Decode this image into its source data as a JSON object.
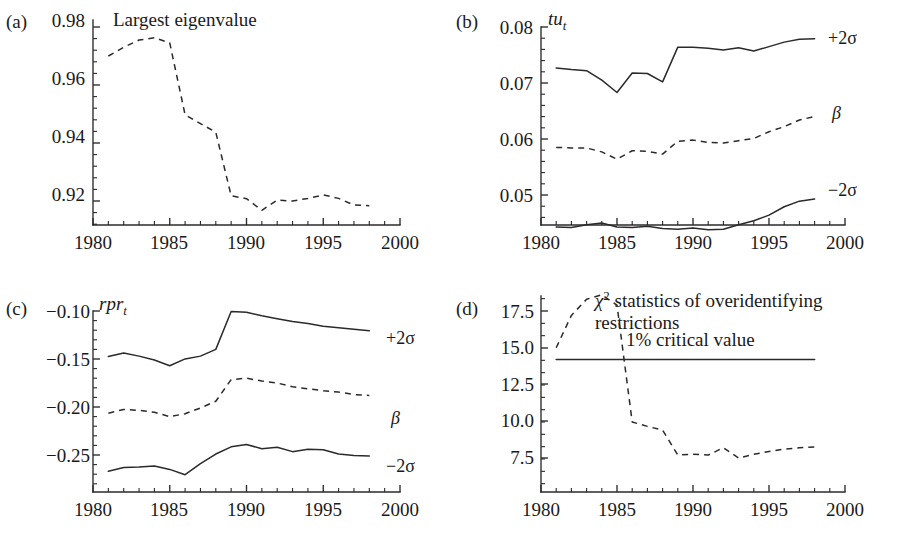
{
  "figure": {
    "background": "#ffffff",
    "ink": "#2a2a2a"
  },
  "panels": {
    "a": {
      "letter": "(a)",
      "title": "Largest eigenvalue",
      "x_ticks": [
        "1980",
        "1985",
        "1990",
        "1995",
        "2000"
      ],
      "y_ticks": [
        "0.98",
        "0.96",
        "0.94",
        "0.92"
      ]
    },
    "b": {
      "letter": "(b)",
      "title_main": "tu",
      "title_sub": "t",
      "x_ticks": [
        "1980",
        "1985",
        "1990",
        "1995",
        "2000"
      ],
      "y_ticks": [
        "0.08",
        "0.07",
        "0.06",
        "0.05"
      ],
      "label_upper": "+2σ",
      "label_mid": "β",
      "label_lower": "−2σ"
    },
    "c": {
      "letter": "(c)",
      "title_main": "rpr",
      "title_sub": "t",
      "x_ticks": [
        "1980",
        "1985",
        "1990",
        "1995",
        "2000"
      ],
      "y_ticks": [
        "−0.10",
        "−0.15",
        "−0.20",
        "−0.25"
      ],
      "label_upper": "+2σ",
      "label_mid": "β",
      "label_lower": "−2σ"
    },
    "d": {
      "letter": "(d)",
      "title_sym": "χ",
      "title_sup": "2",
      "title_line1": " statistics of overidentifying",
      "title_line2": "restrictions",
      "critical_label": "1% critical value",
      "x_ticks": [
        "1980",
        "1985",
        "1990",
        "1995",
        "2000"
      ],
      "y_ticks": [
        "17.5",
        "15.0",
        "12.5",
        "10.0",
        "7.5"
      ]
    }
  },
  "chart_data": [
    {
      "type": "line",
      "panel": "a",
      "title": "Largest eigenvalue",
      "xlabel": "",
      "ylabel": "",
      "xlim": [
        1980,
        2000
      ],
      "ylim": [
        0.9125,
        0.98
      ],
      "grid": false,
      "legend": "none",
      "x": [
        1981,
        1982,
        1983,
        1984,
        1985,
        1986,
        1987,
        1988,
        1989,
        1990,
        1991,
        1992,
        1993,
        1994,
        1995,
        1996,
        1997,
        1998
      ],
      "series": [
        {
          "name": "Largest eigenvalue",
          "style": "dashed",
          "values": [
            0.97,
            0.973,
            0.9755,
            0.9763,
            0.9745,
            0.9497,
            0.9467,
            0.9437,
            0.9218,
            0.9208,
            0.9168,
            0.9203,
            0.92,
            0.9209,
            0.9221,
            0.9209,
            0.9186,
            0.9184
          ]
        }
      ]
    },
    {
      "type": "line",
      "panel": "b",
      "title": "tu_t",
      "xlabel": "",
      "ylabel": "",
      "xlim": [
        1980,
        2000
      ],
      "ylim": [
        0.0425,
        0.08
      ],
      "grid": false,
      "legend": "right-inline",
      "x": [
        1981,
        1982,
        1983,
        1984,
        1985,
        1986,
        1987,
        1988,
        1989,
        1990,
        1991,
        1992,
        1993,
        1994,
        1995,
        1996,
        1997,
        1998
      ],
      "series": [
        {
          "name": "+2σ",
          "style": "solid",
          "values": [
            0.0727,
            0.0724,
            0.0722,
            0.0705,
            0.0683,
            0.0718,
            0.0717,
            0.0702,
            0.0764,
            0.0764,
            0.0762,
            0.0759,
            0.0763,
            0.0757,
            0.0765,
            0.0773,
            0.0778,
            0.0779
          ]
        },
        {
          "name": "β",
          "style": "dashed",
          "values": [
            0.0585,
            0.0584,
            0.0584,
            0.0577,
            0.0564,
            0.0579,
            0.0578,
            0.0573,
            0.0596,
            0.0598,
            0.0594,
            0.0593,
            0.0597,
            0.0601,
            0.0613,
            0.0622,
            0.0634,
            0.064
          ]
        },
        {
          "name": "−2σ",
          "style": "solid",
          "values": [
            0.0443,
            0.0442,
            0.0447,
            0.045,
            0.0443,
            0.0442,
            0.0444,
            0.044,
            0.0439,
            0.0441,
            0.0438,
            0.0439,
            0.0447,
            0.0454,
            0.0464,
            0.0479,
            0.0489,
            0.0493
          ]
        }
      ]
    },
    {
      "type": "line",
      "panel": "c",
      "title": "rpr_t",
      "xlabel": "",
      "ylabel": "",
      "xlim": [
        1980,
        2000
      ],
      "ylim": [
        -0.2745,
        -0.0955
      ],
      "grid": false,
      "legend": "right-inline",
      "x": [
        1981,
        1982,
        1983,
        1984,
        1985,
        1986,
        1987,
        1988,
        1989,
        1990,
        1991,
        1992,
        1993,
        1994,
        1995,
        1996,
        1997,
        1998
      ],
      "series": [
        {
          "name": "+2σ",
          "style": "solid",
          "values": [
            -0.1475,
            -0.1438,
            -0.147,
            -0.151,
            -0.157,
            -0.1499,
            -0.147,
            -0.14,
            -0.1005,
            -0.1012,
            -0.105,
            -0.108,
            -0.111,
            -0.113,
            -0.116,
            -0.1175,
            -0.119,
            -0.1205
          ]
        },
        {
          "name": "β",
          "style": "dashed",
          "values": [
            -0.2065,
            -0.2025,
            -0.2035,
            -0.2055,
            -0.21,
            -0.207,
            -0.201,
            -0.194,
            -0.1715,
            -0.17,
            -0.173,
            -0.175,
            -0.179,
            -0.181,
            -0.183,
            -0.1845,
            -0.187,
            -0.188
          ]
        },
        {
          "name": "−2σ",
          "style": "solid",
          "values": [
            -0.267,
            -0.263,
            -0.2625,
            -0.2615,
            -0.265,
            -0.2705,
            -0.259,
            -0.249,
            -0.2415,
            -0.239,
            -0.2435,
            -0.242,
            -0.2465,
            -0.244,
            -0.2445,
            -0.249,
            -0.2505,
            -0.251
          ]
        }
      ]
    },
    {
      "type": "line",
      "panel": "d",
      "title": "χ² statistics of overidentifying restrictions",
      "xlabel": "",
      "ylabel": "",
      "xlim": [
        1980,
        2000
      ],
      "ylim": [
        6.5,
        19.0
      ],
      "grid": false,
      "legend": "inline-annotation",
      "x": [
        1981,
        1982,
        1983,
        1984,
        1985,
        1986,
        1987,
        1988,
        1989,
        1990,
        1991,
        1992,
        1993,
        1994,
        1995,
        1996,
        1997,
        1998
      ],
      "series": [
        {
          "name": "χ² statistic",
          "style": "dashed",
          "values": [
            15.0,
            17.2,
            18.3,
            18.6,
            17.9,
            9.95,
            9.65,
            9.4,
            7.7,
            7.75,
            7.7,
            8.2,
            7.5,
            7.75,
            7.95,
            8.1,
            8.2,
            8.25
          ]
        },
        {
          "name": "1% critical value",
          "style": "solid-horizontal",
          "value": 14.2
        }
      ]
    }
  ]
}
